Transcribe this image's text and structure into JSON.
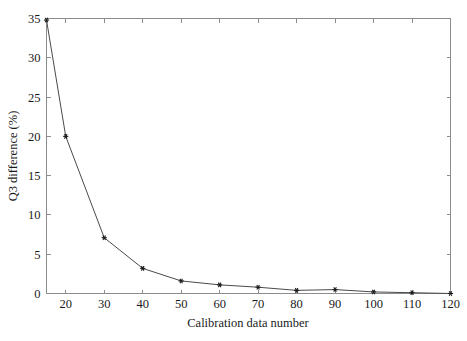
{
  "chart_data": {
    "type": "line",
    "title": "",
    "xlabel": "Calibration data number",
    "ylabel": "Q3 difference (%)",
    "x": [
      15,
      20,
      30,
      40,
      50,
      60,
      70,
      80,
      90,
      100,
      110,
      120
    ],
    "values": [
      34.8,
      20.0,
      7.1,
      3.2,
      1.6,
      1.1,
      0.8,
      0.4,
      0.5,
      0.2,
      0.1,
      0.0
    ],
    "series": [
      {
        "name": "Q3 difference",
        "values": [
          34.8,
          20.0,
          7.1,
          3.2,
          1.6,
          1.1,
          0.8,
          0.4,
          0.5,
          0.2,
          0.1,
          0.0
        ]
      }
    ],
    "xlim": [
      15,
      120
    ],
    "ylim": [
      0,
      35
    ],
    "xticks": [
      20,
      30,
      40,
      50,
      60,
      70,
      80,
      90,
      100,
      110,
      120
    ],
    "xtick_labels": [
      "20",
      "30",
      "40",
      "50",
      "60",
      "70",
      "80",
      "90",
      "100",
      "110",
      "120"
    ],
    "yticks": [
      0,
      5,
      10,
      15,
      20,
      25,
      30,
      35
    ],
    "ytick_labels": [
      "0",
      "5",
      "10",
      "15",
      "20",
      "25",
      "30",
      "35"
    ],
    "grid": false,
    "legend": false,
    "legend_position": "none",
    "marker": "star",
    "line_color": "#4a4a4a",
    "marker_color": "#1a1a1a",
    "frame_color": "#8c8c8c",
    "background_color": "#ffffff"
  },
  "axis": {
    "x_title": "Calibration data number",
    "y_title": "Q3 difference (%)"
  }
}
